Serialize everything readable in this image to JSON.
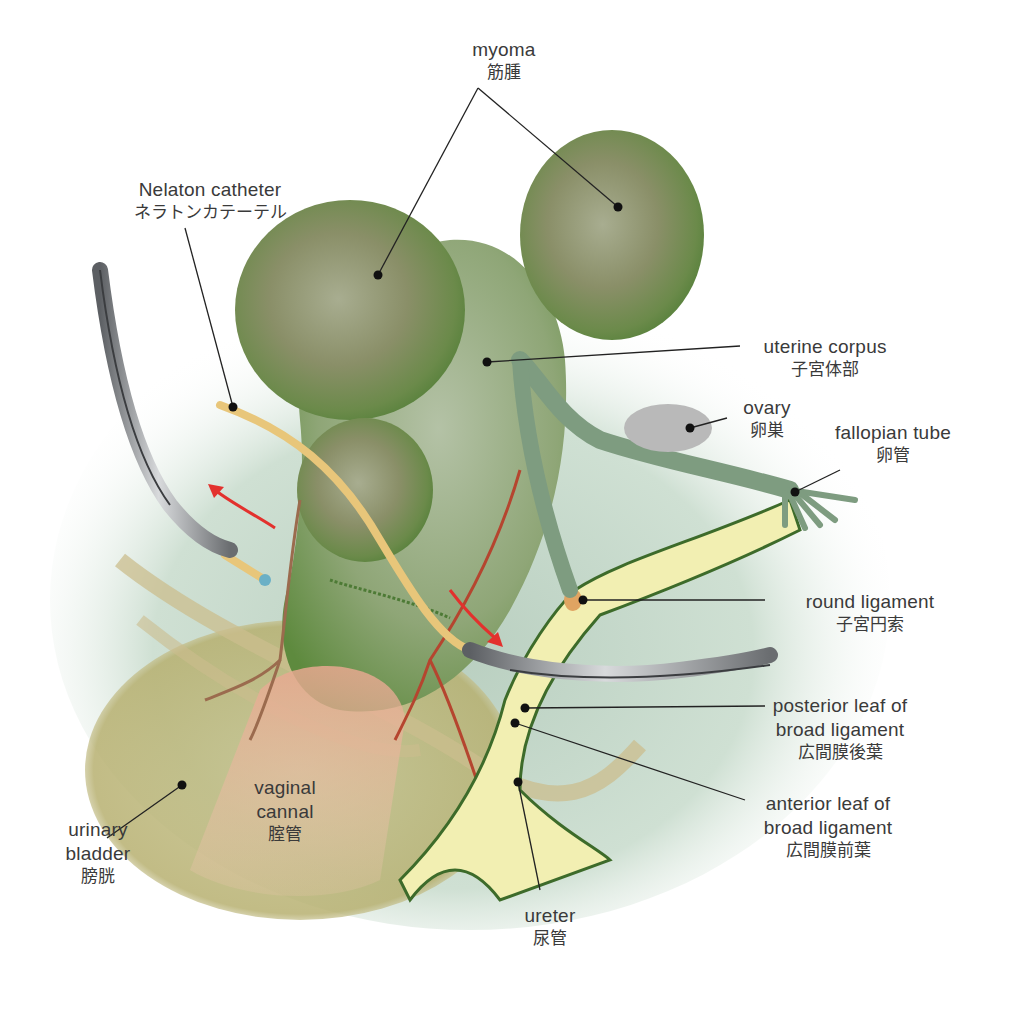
{
  "figure": {
    "colors": {
      "myoma_green": "#6e8a4e",
      "uterus_green": "#7d9b63",
      "background_mint": "#c9dccd",
      "ligament_yellow": "#f2efb2",
      "ligament_outline": "#3d6b2a",
      "catheter_tan": "#e8c67a",
      "vagina_pink": "#e2a894",
      "bladder_olive": "#b9b47a",
      "vessel_red": "#b5452f",
      "arrow_red": "#e3312d",
      "forceps_gray": "#8a8d90",
      "ovary_gray": "#b8b8b8",
      "leader_line": "#222222"
    },
    "arrows": [
      {
        "name": "upper-left-arrow",
        "direction": "up-left",
        "color": "#e3312d"
      },
      {
        "name": "right-down-arrow",
        "direction": "down-right",
        "color": "#e3312d"
      }
    ]
  },
  "labels": {
    "myoma": {
      "en": "myoma",
      "ja": "筋腫"
    },
    "nelaton_catheter": {
      "en": "Nelaton catheter",
      "ja": "ネラトンカテーテル"
    },
    "uterine_corpus": {
      "en": "uterine corpus",
      "ja": "子宮体部"
    },
    "ovary": {
      "en": "ovary",
      "ja": "卵巣"
    },
    "fallopian_tube": {
      "en": "fallopian tube",
      "ja": "卵管"
    },
    "round_ligament": {
      "en": "round ligament",
      "ja": "子宮円索"
    },
    "posterior_leaf": {
      "en1": "posterior leaf of",
      "en2": "broad ligament",
      "ja": "広間膜後葉"
    },
    "anterior_leaf": {
      "en1": "anterior leaf of",
      "en2": "broad ligament",
      "ja": "広間膜前葉"
    },
    "ureter": {
      "en": "ureter",
      "ja": "尿管"
    },
    "urinary_bladder": {
      "en1": "urinary",
      "en2": "bladder",
      "ja": "膀胱"
    },
    "vaginal_canal": {
      "en1": "vaginal",
      "en2": "cannal",
      "ja": "腟管"
    }
  }
}
